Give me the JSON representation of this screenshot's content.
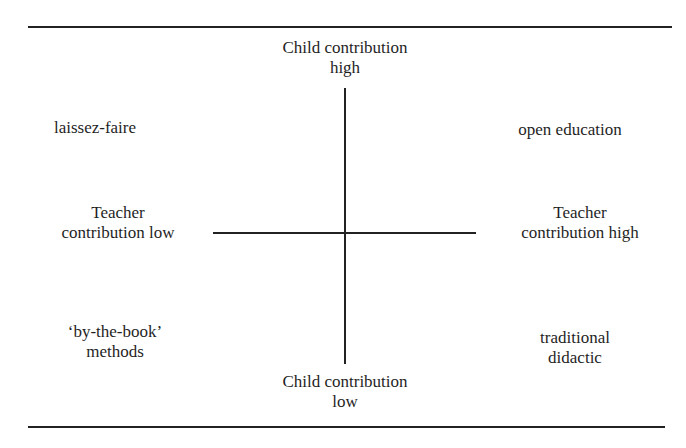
{
  "diagram": {
    "type": "quadrant",
    "axes": {
      "vertical": {
        "top_label": [
          "Child contribution",
          "high"
        ],
        "bottom_label": [
          "Child contribution",
          "low"
        ]
      },
      "horizontal": {
        "left_label": [
          "Teacher",
          "contribution low"
        ],
        "right_label": [
          "Teacher",
          "contribution high"
        ]
      }
    },
    "quadrants": {
      "top_left": [
        "laissez-faire"
      ],
      "top_right": [
        "open education"
      ],
      "bottom_left": [
        "‘by-the-book’",
        "methods"
      ],
      "bottom_right": [
        "traditional",
        "didactic"
      ]
    }
  }
}
